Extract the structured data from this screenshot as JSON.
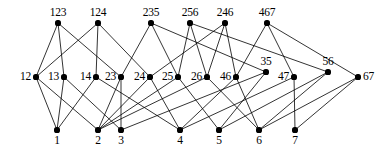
{
  "figure": {
    "width": 386,
    "height": 154,
    "background": "#ffffff",
    "edge_color": "#000000",
    "node_color": "#000000"
  },
  "chart_data": {
    "type": "diagram",
    "subtype": "hasse-lattice-graph",
    "title": "",
    "levels": [
      {
        "name": "top",
        "y": 23,
        "nodes": [
          {
            "id": "123",
            "label": "123",
            "x": 58,
            "y": 23,
            "label_pos": "above"
          },
          {
            "id": "124",
            "label": "124",
            "x": 98,
            "y": 23,
            "label_pos": "above"
          },
          {
            "id": "235",
            "label": "235",
            "x": 151,
            "y": 23,
            "label_pos": "above"
          },
          {
            "id": "256",
            "label": "256",
            "x": 190,
            "y": 23,
            "label_pos": "above"
          },
          {
            "id": "246",
            "label": "246",
            "x": 225,
            "y": 23,
            "label_pos": "above"
          },
          {
            "id": "467",
            "label": "467",
            "x": 267,
            "y": 23,
            "label_pos": "above"
          }
        ]
      },
      {
        "name": "middle",
        "y": 77,
        "nodes": [
          {
            "id": "12",
            "label": "12",
            "x": 36,
            "y": 77,
            "label_pos": "left"
          },
          {
            "id": "13",
            "label": "13",
            "x": 64,
            "y": 77,
            "label_pos": "left"
          },
          {
            "id": "14",
            "label": "14",
            "x": 96,
            "y": 77,
            "label_pos": "left"
          },
          {
            "id": "23",
            "label": "23",
            "x": 121,
            "y": 77,
            "label_pos": "left"
          },
          {
            "id": "24",
            "label": "24",
            "x": 150,
            "y": 77,
            "label_pos": "left"
          },
          {
            "id": "25",
            "label": "25",
            "x": 178,
            "y": 77,
            "label_pos": "left"
          },
          {
            "id": "26",
            "label": "26",
            "x": 207,
            "y": 77,
            "label_pos": "left"
          },
          {
            "id": "46",
            "label": "46",
            "x": 236,
            "y": 77,
            "label_pos": "left"
          },
          {
            "id": "35",
            "label": "35",
            "x": 266,
            "y": 72,
            "label_pos": "above"
          },
          {
            "id": "47",
            "label": "47",
            "x": 294,
            "y": 77,
            "label_pos": "left"
          },
          {
            "id": "56",
            "label": "56",
            "x": 328,
            "y": 72,
            "label_pos": "above"
          },
          {
            "id": "67",
            "label": "67",
            "x": 358,
            "y": 77,
            "label_pos": "right"
          }
        ]
      },
      {
        "name": "bottom",
        "y": 130,
        "nodes": [
          {
            "id": "1",
            "label": "1",
            "x": 57,
            "y": 130,
            "label_pos": "below"
          },
          {
            "id": "2",
            "label": "2",
            "x": 98,
            "y": 130,
            "label_pos": "below"
          },
          {
            "id": "3",
            "label": "3",
            "x": 121,
            "y": 130,
            "label_pos": "below"
          },
          {
            "id": "4",
            "label": "4",
            "x": 180,
            "y": 130,
            "label_pos": "below"
          },
          {
            "id": "5",
            "label": "5",
            "x": 219,
            "y": 130,
            "label_pos": "below"
          },
          {
            "id": "6",
            "label": "6",
            "x": 259,
            "y": 130,
            "label_pos": "below"
          },
          {
            "id": "7",
            "label": "7",
            "x": 295,
            "y": 130,
            "label_pos": "below"
          }
        ]
      }
    ],
    "edges": [
      {
        "from": "123",
        "to": "12"
      },
      {
        "from": "123",
        "to": "13"
      },
      {
        "from": "123",
        "to": "23"
      },
      {
        "from": "124",
        "to": "12"
      },
      {
        "from": "124",
        "to": "14"
      },
      {
        "from": "124",
        "to": "24"
      },
      {
        "from": "235",
        "to": "23"
      },
      {
        "from": "235",
        "to": "25"
      },
      {
        "from": "235",
        "to": "35"
      },
      {
        "from": "256",
        "to": "25"
      },
      {
        "from": "256",
        "to": "26"
      },
      {
        "from": "256",
        "to": "56"
      },
      {
        "from": "246",
        "to": "24"
      },
      {
        "from": "246",
        "to": "26"
      },
      {
        "from": "246",
        "to": "46"
      },
      {
        "from": "467",
        "to": "46"
      },
      {
        "from": "467",
        "to": "47"
      },
      {
        "from": "467",
        "to": "67"
      },
      {
        "from": "12",
        "to": "1"
      },
      {
        "from": "12",
        "to": "2"
      },
      {
        "from": "13",
        "to": "1"
      },
      {
        "from": "13",
        "to": "3"
      },
      {
        "from": "14",
        "to": "1"
      },
      {
        "from": "14",
        "to": "4"
      },
      {
        "from": "23",
        "to": "2"
      },
      {
        "from": "23",
        "to": "3"
      },
      {
        "from": "24",
        "to": "2"
      },
      {
        "from": "24",
        "to": "4"
      },
      {
        "from": "25",
        "to": "2"
      },
      {
        "from": "25",
        "to": "5"
      },
      {
        "from": "26",
        "to": "2"
      },
      {
        "from": "26",
        "to": "6"
      },
      {
        "from": "46",
        "to": "4"
      },
      {
        "from": "46",
        "to": "6"
      },
      {
        "from": "35",
        "to": "3"
      },
      {
        "from": "35",
        "to": "5"
      },
      {
        "from": "47",
        "to": "4"
      },
      {
        "from": "47",
        "to": "7"
      },
      {
        "from": "56",
        "to": "5"
      },
      {
        "from": "56",
        "to": "6"
      },
      {
        "from": "67",
        "to": "6"
      },
      {
        "from": "67",
        "to": "7"
      }
    ]
  }
}
